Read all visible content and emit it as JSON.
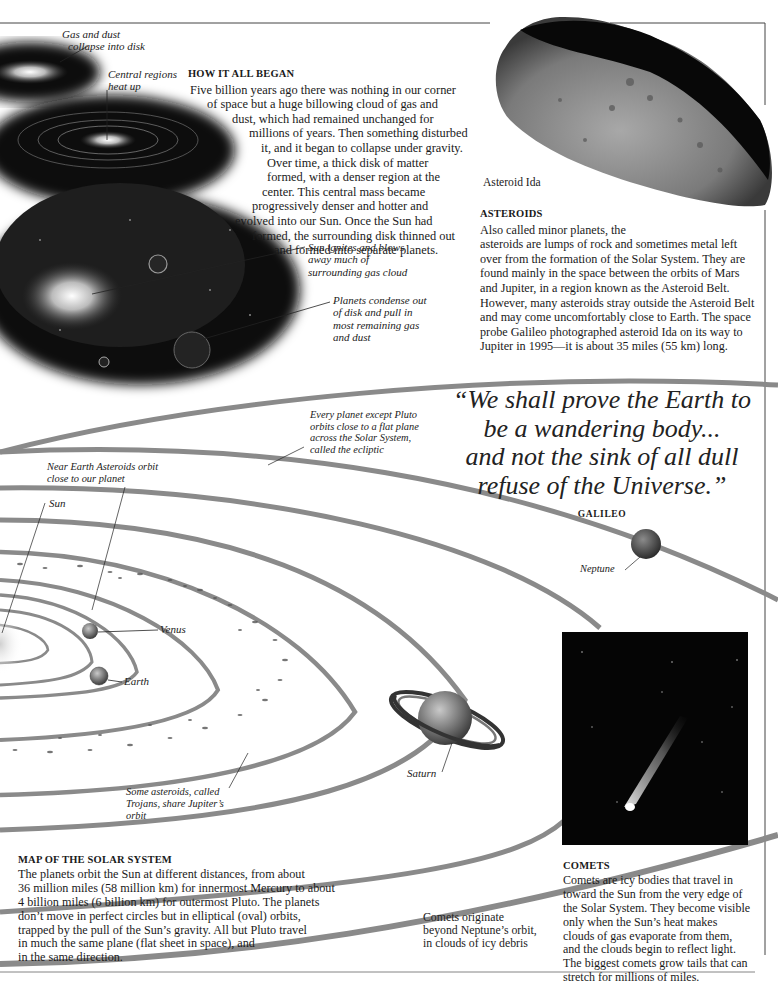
{
  "formation": {
    "heading": "HOW IT ALL BEGAN",
    "lines": [
      "Five billion years ago there was nothing in our corner",
      "of space but a huge billowing cloud of gas and",
      "dust, which had remained unchanged for",
      "millions of years. Then something disturbed",
      "it, and it began to collapse under gravity.",
      "Over time, a thick disk of matter",
      "formed, with a denser region at the",
      "center. This central mass became",
      "progressively denser and hotter and",
      "evolved into our Sun. Once the Sun had",
      "formed, the surrounding disk thinned out",
      "and formed into separate planets."
    ],
    "captions": {
      "gas_dust": [
        "Gas and dust",
        "collapse into disk"
      ],
      "central": [
        "Central regions",
        "heat up"
      ],
      "sun_ignites": [
        "Sun ignites and blows",
        "away much of",
        "surrounding gas cloud"
      ],
      "planets_condense": [
        "Planets condense out",
        "of disk and pull in",
        "most remaining gas",
        "and dust"
      ]
    }
  },
  "asteroids": {
    "photo_caption": "Asteroid Ida",
    "heading": "ASTEROIDS",
    "lines": [
      "Also called minor planets, the",
      "asteroids are lumps of rock and sometimes metal left",
      "over from the formation of the Solar System. They are",
      "found mainly in the space between the orbits of Mars",
      "and Jupiter, in a region known as the Asteroid Belt.",
      "However, many asteroids stray outside the Asteroid Belt",
      "and may come uncomfortably close to Earth. The space",
      "probe Galileo photographed asteroid Ida on its way to",
      "Jupiter in 1995—it is about 35 miles (55 km) long."
    ]
  },
  "quote": {
    "lines": [
      "“We shall prove the Earth to",
      "be a wandering body...",
      "and not the sink of all dull",
      "refuse of the Universe.”"
    ],
    "author": "GALILEO"
  },
  "map": {
    "captions": {
      "ecliptic": [
        "Every planet except Pluto",
        "orbits close to a flat plane",
        "across the Solar System,",
        "called the ecliptic"
      ],
      "near_earth": [
        "Near Earth Asteroids orbit",
        "close to our planet"
      ],
      "trojans": [
        "Some asteroids, called",
        "Trojans, share Jupiter’s",
        "orbit"
      ],
      "comets_origin": [
        "Comets originate",
        "beyond Neptune’s orbit,",
        "in clouds of icy debris"
      ]
    },
    "labels": {
      "sun": "Sun",
      "venus": "Venus",
      "earth": "Earth",
      "saturn": "Saturn",
      "neptune": "Neptune"
    },
    "heading": "MAP OF THE SOLAR SYSTEM",
    "lines": [
      "The planets orbit the Sun at different distances, from about",
      "36 million miles (58 million km) for innermost Mercury to about",
      "4 billion miles (6 billion km) for outermost Pluto. The planets",
      "don’t move in perfect circles but in elliptical (oval) orbits,",
      "trapped by the pull of the Sun’s gravity. All but Pluto travel",
      "in much the same plane (flat sheet in space), and",
      "in the same direction."
    ]
  },
  "comets": {
    "heading": "COMETS",
    "lines": [
      "Comets are icy bodies that travel in",
      "toward the Sun from the very edge of",
      "the Solar System. They become visible",
      "only when the Sun’s heat makes",
      "clouds of gas evaporate from them,",
      "and the clouds begin to reflect light.",
      "The biggest comets grow tails that can",
      "stretch for millions of miles."
    ]
  },
  "colors": {
    "orbit_band": "#8a8a8a",
    "frame_line": "#444444",
    "space_black": "#050505"
  }
}
